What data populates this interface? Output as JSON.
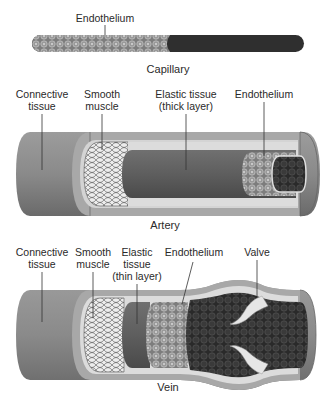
{
  "capillary": {
    "caption": "Capillary",
    "labels": {
      "endothelium": "Endothelium"
    }
  },
  "artery": {
    "caption": "Artery",
    "labels": {
      "connective_1": "Connective",
      "connective_2": "tissue",
      "smooth_1": "Smooth",
      "smooth_2": "muscle",
      "elastic_1": "Elastic tissue",
      "elastic_2": "(thick layer)",
      "endothelium": "Endothelium"
    }
  },
  "vein": {
    "caption": "Vein",
    "labels": {
      "connective_1": "Connective",
      "connective_2": "tissue",
      "smooth_1": "Smooth",
      "smooth_2": "muscle",
      "elastic_1": "Elastic",
      "elastic_2": "tissue",
      "elastic_3": "(thin layer)",
      "endothelium": "Endothelium",
      "valve": "Valve"
    }
  },
  "colors": {
    "outer_tissue": "#8a8a8a",
    "outer_tissue_dark": "#6e6e6e",
    "light_layer": "#c9c9c9",
    "elastic": "#5f5f5f",
    "lumen": "#2c2c2c",
    "cell_fill": "#9a9a9a",
    "cell_stroke": "#c8c8c8"
  }
}
